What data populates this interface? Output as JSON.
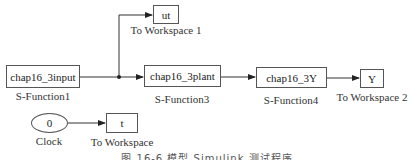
{
  "diagram": {
    "type": "simulink-model",
    "blocks": [
      {
        "id": "s_function1",
        "text": "chap16_3input",
        "label": "S-Function1"
      },
      {
        "id": "s_function3",
        "text": "chap16_3plant",
        "label": "S-Function3"
      },
      {
        "id": "s_function4",
        "text": "chap16_3Y",
        "label": "S-Function4"
      },
      {
        "id": "to_workspace1",
        "text": "ut",
        "label": "To Workspace 1"
      },
      {
        "id": "to_workspace2",
        "text": "Y",
        "label": "To Workspace 2"
      },
      {
        "id": "clock",
        "text": "0",
        "label": "Clock"
      },
      {
        "id": "to_workspace",
        "text": "t",
        "label": "To Workspace"
      }
    ],
    "connections": [
      {
        "from": "S-Function1",
        "to": "S-Function3",
        "branch": true
      },
      {
        "from": "S-Function1",
        "to": "To Workspace 1",
        "branch": true
      },
      {
        "from": "S-Function3",
        "to": "S-Function4"
      },
      {
        "from": "S-Function4",
        "to": "To Workspace 2"
      },
      {
        "from": "Clock",
        "to": "To Workspace"
      }
    ],
    "caption": "图 16-6   模型 Simulink 测试程序"
  }
}
